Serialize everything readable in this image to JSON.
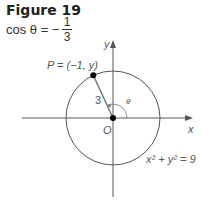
{
  "figure": {
    "title": "Figure 19",
    "equation_lhs": "cos θ =",
    "equation_sign": "−",
    "fraction_numerator": "1",
    "fraction_denominator": "3"
  },
  "diagram": {
    "point_label": "P = (−1, y)",
    "radius_label": "3",
    "angle_label": "θ",
    "origin_label": "O",
    "x_axis_label": "x",
    "y_axis_label": "y",
    "circle_equation": "x² + y² = 9",
    "circle_radius": 3,
    "point_x": -1,
    "colors": {
      "stroke": "#555555",
      "point": "#000000",
      "radius_line": "#777777"
    }
  }
}
